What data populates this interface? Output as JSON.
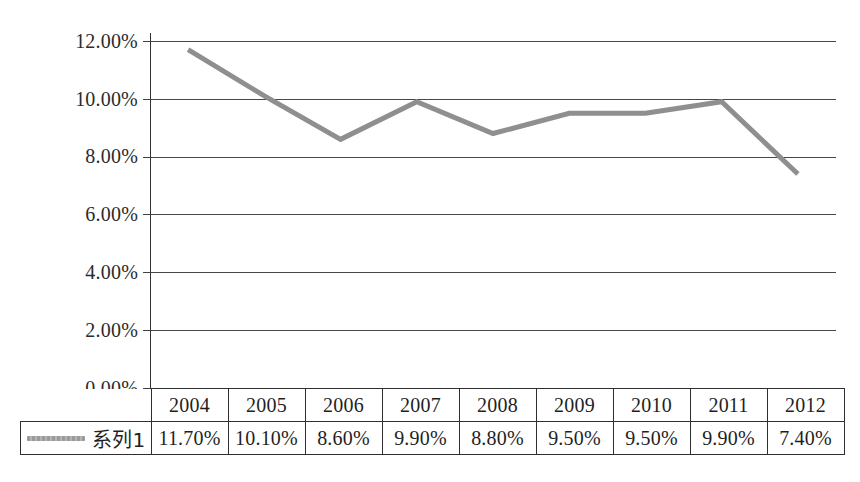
{
  "chart_data": {
    "type": "line",
    "title": "",
    "subtitle": "",
    "xlabel": "",
    "ylabel": "",
    "categories": [
      "2004",
      "2005",
      "2006",
      "2007",
      "2008",
      "2009",
      "2010",
      "2011",
      "2012"
    ],
    "series": [
      {
        "name": "系列1",
        "values": [
          11.7,
          10.1,
          8.6,
          9.9,
          8.8,
          9.5,
          9.5,
          9.9,
          7.4
        ],
        "value_labels": [
          "11.70%",
          "10.10%",
          "8.60%",
          "9.90%",
          "8.80%",
          "9.50%",
          "9.50%",
          "9.90%",
          "7.40%"
        ],
        "color": "#8f8f8f"
      }
    ],
    "ylim": [
      0,
      12
    ],
    "ytick_values": [
      0,
      2,
      4,
      6,
      8,
      10,
      12
    ],
    "ytick_labels": [
      "0.00%",
      "2.00%",
      "4.00%",
      "6.00%",
      "8.00%",
      "10.00%",
      "12.00%"
    ],
    "grid": true,
    "grid_axis": "y",
    "legend": "data-table-row",
    "data_table_visible": true,
    "markers": false,
    "line_width_px": 5
  },
  "table": {
    "legend_label": "系列1",
    "legend_swatch_color": "#9a9a9a",
    "header_row": [
      "2004",
      "2005",
      "2006",
      "2007",
      "2008",
      "2009",
      "2010",
      "2011",
      "2012"
    ],
    "value_row": [
      "11.70%",
      "10.10%",
      "8.60%",
      "9.90%",
      "8.80%",
      "9.50%",
      "9.50%",
      "9.90%",
      "7.40%"
    ]
  },
  "axis": {
    "y_labels": [
      "12.00%",
      "10.00%",
      "8.00%",
      "6.00%",
      "4.00%",
      "2.00%",
      "0.00%"
    ]
  },
  "colors": {
    "line": "#8f8f8f",
    "grid": "#2e2e2e",
    "text": "#1f1f1f",
    "background": "#ffffff"
  }
}
